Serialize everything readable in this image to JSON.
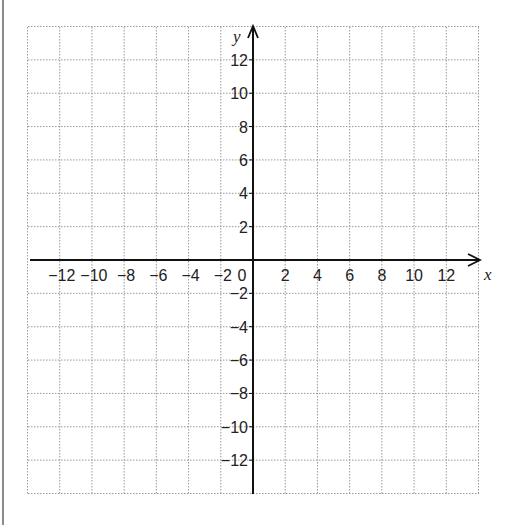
{
  "chart_data": {
    "type": "scatter",
    "title": "",
    "xlabel": "x",
    "ylabel": "y",
    "xlim": [
      -14,
      14
    ],
    "ylim": [
      -14,
      14
    ],
    "grid": true,
    "grid_style": "dotted",
    "grid_spacing": 2,
    "x_ticks": [
      -12,
      -10,
      -8,
      -6,
      -4,
      -2,
      0,
      2,
      4,
      6,
      8,
      10,
      12
    ],
    "y_ticks": [
      12,
      10,
      8,
      6,
      4,
      2,
      -2,
      -4,
      -6,
      -8,
      -10,
      -12
    ],
    "x_tick_labels": [
      "−12",
      "−10",
      "−8",
      "−6",
      "−4",
      "−2",
      "0",
      "2",
      "4",
      "6",
      "8",
      "10",
      "12"
    ],
    "y_tick_labels": [
      "12",
      "10",
      "8",
      "6",
      "4",
      "2",
      "−2",
      "−4",
      "−6",
      "−8",
      "−10",
      "−12"
    ],
    "series": [],
    "legend": null
  },
  "colors": {
    "axis": "#111111",
    "grid": "#9a9a9a",
    "text": "#222222",
    "border": "#8a8a8a"
  },
  "layout": {
    "grid_left": 28,
    "grid_top": 27,
    "grid_right": 479,
    "grid_bottom": 494,
    "origin_x": 253,
    "origin_y": 260
  }
}
